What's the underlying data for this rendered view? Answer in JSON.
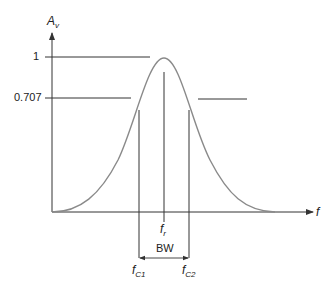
{
  "diagram": {
    "type": "frequency-response-curve",
    "y_axis": {
      "label_main": "A",
      "label_sub": "v"
    },
    "x_axis": {
      "label": "f"
    },
    "y_ticks": [
      {
        "label": "1"
      },
      {
        "label": "0.707"
      }
    ],
    "markers": {
      "fc1": {
        "main": "f",
        "sub": "C1"
      },
      "fr": {
        "main": "f",
        "sub": "r"
      },
      "fc2": {
        "main": "f",
        "sub": "C2"
      }
    },
    "bandwidth_label": "BW",
    "colors": {
      "curve": "#8a8a8a",
      "lines": "#333333",
      "text": "#222222"
    }
  }
}
